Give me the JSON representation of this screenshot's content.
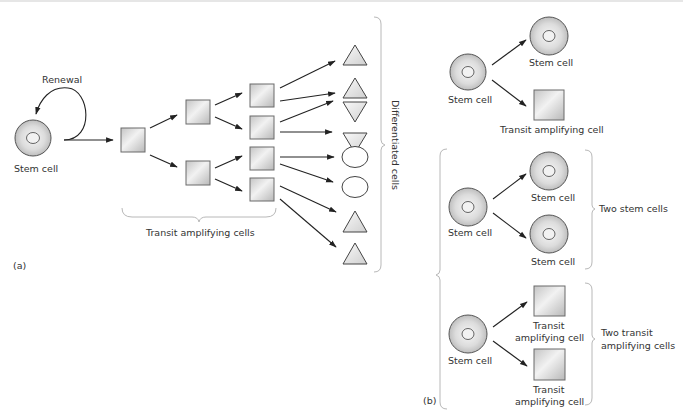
{
  "figure": {
    "panel_a": {
      "label": "(a)",
      "renewal_label": "Renewal",
      "stem_cell_label": "Stem cell",
      "transit_label": "Transit amplifying cells",
      "differentiated_label": "Differentiated  cells",
      "differentiated_shapes": [
        "triangle-up",
        "triangle-up",
        "triangle-down",
        "triangle-down",
        "ellipse",
        "ellipse",
        "triangle-up",
        "triangle-up"
      ]
    },
    "panel_b": {
      "label": "(b)",
      "asymmetric": {
        "parent_label": "Stem cell",
        "child_stem_label": "Stem cell",
        "child_transit_label": "Transit amplifying cell"
      },
      "symmetric_stem": {
        "parent_label": "Stem cell",
        "child1_label": "Stem cell",
        "child2_label": "Stem cell",
        "group_label": "Two stem cells"
      },
      "symmetric_transit": {
        "parent_label": "Stem cell",
        "child1_label_line1": "Transit",
        "child1_label_line2": "amplifying cell",
        "child2_label_line1": "Transit",
        "child2_label_line2": "amplifying cell",
        "group_label_line1": "Two transit",
        "group_label_line2": "amplifying cells"
      }
    },
    "colors": {
      "cell_fill_center": "#f4f4f4",
      "cell_fill_edge": "#bdbdbd",
      "square_fill": "#d9d9d9",
      "triangle_fill": "#e8e8e8",
      "text": "#333333",
      "brace": "#b8b8b8"
    }
  }
}
